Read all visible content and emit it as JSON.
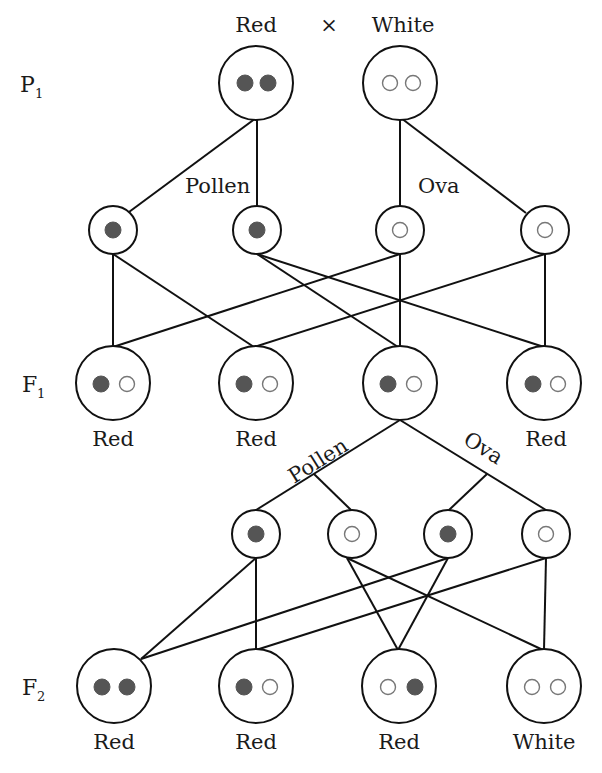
{
  "title": {
    "left": "Red",
    "cross": "×",
    "right": "White"
  },
  "generations": {
    "p1": {
      "letter": "P",
      "sub": "1"
    },
    "f1": {
      "letter": "F",
      "sub": "1"
    },
    "f2": {
      "letter": "F",
      "sub": "2"
    }
  },
  "gamete_labels": {
    "p1_pollen": "Pollen",
    "p1_ova": "Ova",
    "f1_pollen": "Pollen",
    "f1_ova": "Ova"
  },
  "colors": {
    "red_allele": "#555555",
    "white_allele": "#ffffff",
    "line": "#111111"
  },
  "p1_parents": [
    {
      "cx": 256,
      "cy": 83,
      "r": 37,
      "alleles": [
        "R",
        "R"
      ],
      "phenotype": "Red"
    },
    {
      "cx": 400,
      "cy": 83,
      "r": 37,
      "alleles": [
        "W",
        "W"
      ],
      "phenotype": "White"
    }
  ],
  "p1_gametes": [
    {
      "cx": 113,
      "cy": 230,
      "r": 24,
      "allele": "R",
      "type": "pollen"
    },
    {
      "cx": 257,
      "cy": 230,
      "r": 24,
      "allele": "R",
      "type": "pollen"
    },
    {
      "cx": 400,
      "cy": 230,
      "r": 24,
      "allele": "W",
      "type": "ova"
    },
    {
      "cx": 545,
      "cy": 230,
      "r": 24,
      "allele": "W",
      "type": "ova"
    }
  ],
  "f1_offspring": [
    {
      "cx": 113,
      "cy": 383,
      "r": 37,
      "alleles": [
        "R",
        "W"
      ],
      "phenotype": "Red"
    },
    {
      "cx": 256,
      "cy": 383,
      "r": 37,
      "alleles": [
        "R",
        "W"
      ],
      "phenotype": "Red"
    },
    {
      "cx": 400,
      "cy": 383,
      "r": 37,
      "alleles": [
        "R",
        "W"
      ],
      "phenotype": ""
    },
    {
      "cx": 544,
      "cy": 383,
      "r": 37,
      "alleles": [
        "R",
        "W"
      ],
      "phenotype": "Red"
    }
  ],
  "f1_gametes": [
    {
      "cx": 256,
      "cy": 534,
      "r": 24,
      "allele": "R",
      "type": "pollen"
    },
    {
      "cx": 352,
      "cy": 534,
      "r": 24,
      "allele": "W",
      "type": "pollen"
    },
    {
      "cx": 448,
      "cy": 534,
      "r": 24,
      "allele": "R",
      "type": "ova"
    },
    {
      "cx": 546,
      "cy": 534,
      "r": 24,
      "allele": "W",
      "type": "ova"
    }
  ],
  "f2_offspring": [
    {
      "cx": 114,
      "cy": 686,
      "r": 37,
      "alleles": [
        "R",
        "R"
      ],
      "phenotype": "Red"
    },
    {
      "cx": 256,
      "cy": 686,
      "r": 37,
      "alleles": [
        "R",
        "W"
      ],
      "phenotype": "Red"
    },
    {
      "cx": 399,
      "cy": 686,
      "r": 37,
      "alleles": [
        "W",
        "R"
      ],
      "phenotype": "Red"
    },
    {
      "cx": 544,
      "cy": 686,
      "r": 37,
      "alleles": [
        "W",
        "W"
      ],
      "phenotype": "White"
    }
  ],
  "phenotype_labels": {
    "f1": [
      "Red",
      "Red",
      "",
      "Red"
    ],
    "f2": [
      "Red",
      "Red",
      "Red",
      "White"
    ]
  }
}
